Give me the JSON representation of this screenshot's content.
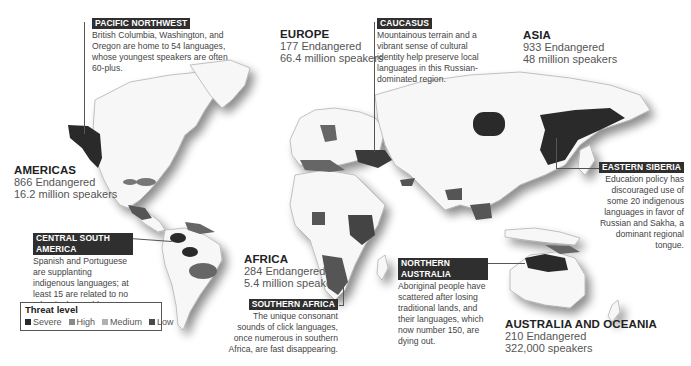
{
  "regions": {
    "americas": {
      "name": "AMERICAS",
      "endangered": "866 Endangered",
      "speakers": "16.2 million speakers"
    },
    "europe": {
      "name": "EUROPE",
      "endangered": "177 Endangered",
      "speakers": "66.4 million speakers"
    },
    "asia": {
      "name": "ASIA",
      "endangered": "933 Endangered",
      "speakers": "48 million speakers"
    },
    "africa": {
      "name": "AFRICA",
      "endangered": "284 Endangered",
      "speakers": "5.4 million speakers"
    },
    "oceania": {
      "name": "AUSTRALIA AND OCEANIA",
      "endangered": "210 Endangered",
      "speakers": "322,000 speakers"
    }
  },
  "callouts": {
    "pacific_northwest": {
      "tag": "PACIFIC NORTHWEST",
      "text": "British Columbia, Washington, and Oregon are home to 54 languages, whose youngest speakers are often 60-plus."
    },
    "caucasus": {
      "tag": "CAUCASUS",
      "text": "Mountainous terrain and a vibrant sense of cultural identity help preserve local languages in this Russian-dominated region."
    },
    "eastern_siberia": {
      "tag": "EASTERN SIBERIA",
      "text": "Education policy has discouraged use of some 20 indigenous languages in favor of Russian and Sakha, a dominant regional tongue."
    },
    "central_south_america": {
      "tag": "CENTRAL SOUTH AMERICA",
      "text": "Spanish and Portuguese are supplanting indigenous languages; at least 15 are related to no other in the world."
    },
    "southern_africa": {
      "tag": "SOUTHERN AFRICA",
      "text": "The unique consonant sounds of click languages, once numerous in southern Africa, are fast disappearing."
    },
    "northern_australia": {
      "tag": "NORTHERN AUSTRALIA",
      "text": "Aboriginal people have scattered after losing traditional lands, and their languages, which now number 150, are dying out."
    }
  },
  "legend": {
    "title": "Threat level",
    "items": [
      {
        "label": "Severe",
        "color": "#2a2a2a"
      },
      {
        "label": "High",
        "color": "#6a6a6a"
      },
      {
        "label": "Medium",
        "color": "#9a9a9a"
      },
      {
        "label": "Low",
        "color": "#4a4a4a"
      }
    ]
  },
  "colors": {
    "land": "#f7f7f7",
    "land_stroke": "#9a9a9a",
    "severe": "#2a2a2a",
    "high": "#555555",
    "medium": "#888888",
    "low": "#6a6a6a"
  }
}
